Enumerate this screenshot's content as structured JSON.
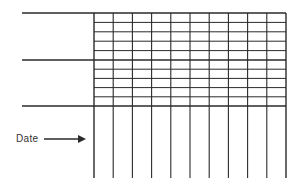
{
  "diagram": {
    "type": "grid-form",
    "arrow_label": "Date",
    "colors": {
      "line": "#2a2a2a",
      "background": "#ffffff"
    },
    "grid": {
      "columns": 10,
      "sections": 2,
      "rows_per_section": 5,
      "left": 94,
      "right": 286,
      "top": 13,
      "middle": 60,
      "bottom": 106,
      "column_bottom": 178
    },
    "left_lines_start_x": 22
  }
}
